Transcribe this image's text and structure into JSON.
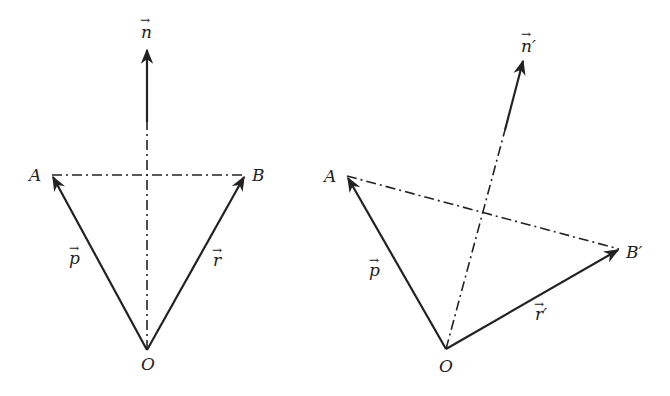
{
  "diagram": {
    "left": {
      "labels": {
        "n": "n",
        "A": "A",
        "B": "B",
        "O": "O",
        "p": "p",
        "r": "r"
      },
      "arrow_glyph": "→"
    },
    "right": {
      "labels": {
        "n": "n′",
        "A": "A",
        "B": "B′",
        "O": "O",
        "p": "p",
        "r": "r′"
      },
      "arrow_glyph": "→"
    }
  }
}
